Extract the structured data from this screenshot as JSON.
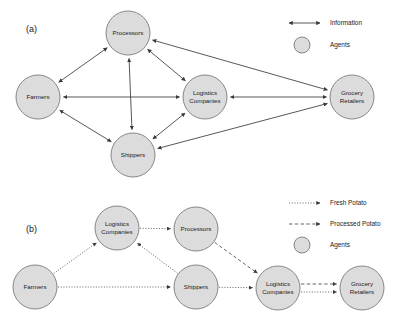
{
  "figure": {
    "panels": [
      {
        "id": "a",
        "label": "(a)",
        "nodes": [
          {
            "id": "a-processors",
            "label_line1": "Processors",
            "label_line2": "",
            "cx": 128,
            "cy": 33,
            "r": 22
          },
          {
            "id": "a-farmers",
            "label_line1": "Farmers",
            "label_line2": "",
            "cx": 38,
            "cy": 97,
            "r": 22
          },
          {
            "id": "a-logistics",
            "label_line1": "Logistics",
            "label_line2": "Companies",
            "cx": 205,
            "cy": 97,
            "r": 22
          },
          {
            "id": "a-grocery",
            "label_line1": "Grocery",
            "label_line2": "Retailers",
            "cx": 352,
            "cy": 97,
            "r": 22
          },
          {
            "id": "a-shippers",
            "label_line1": "Shippers",
            "label_line2": "",
            "cx": 133,
            "cy": 155,
            "r": 22
          }
        ],
        "edges": [
          {
            "from": "a-farmers",
            "to": "a-processors",
            "style": "solid",
            "arrows": "both"
          },
          {
            "from": "a-farmers",
            "to": "a-logistics",
            "style": "solid",
            "arrows": "both"
          },
          {
            "from": "a-farmers",
            "to": "a-shippers",
            "style": "solid",
            "arrows": "both"
          },
          {
            "from": "a-processors",
            "to": "a-logistics",
            "style": "solid",
            "arrows": "both"
          },
          {
            "from": "a-processors",
            "to": "a-shippers",
            "style": "solid",
            "arrows": "both"
          },
          {
            "from": "a-processors",
            "to": "a-grocery",
            "style": "solid",
            "arrows": "both"
          },
          {
            "from": "a-logistics",
            "to": "a-shippers",
            "style": "solid",
            "arrows": "both"
          },
          {
            "from": "a-logistics",
            "to": "a-grocery",
            "style": "solid",
            "arrows": "both"
          },
          {
            "from": "a-shippers",
            "to": "a-grocery",
            "style": "solid",
            "arrows": "both"
          }
        ],
        "legend": [
          {
            "id": "a-legend-information",
            "kind": "arrow-both",
            "style": "solid",
            "label": "Information"
          },
          {
            "id": "a-legend-agents",
            "kind": "circle",
            "style": "node",
            "label": "Agents"
          }
        ]
      },
      {
        "id": "b",
        "label": "(b)",
        "nodes": [
          {
            "id": "b-logistics-1",
            "label_line1": "Logistics",
            "label_line2": "Companies",
            "cx": 117,
            "cy": 228,
            "r": 22
          },
          {
            "id": "b-processors",
            "label_line1": "Processors",
            "label_line2": "",
            "cx": 196,
            "cy": 229,
            "r": 22
          },
          {
            "id": "b-farmers",
            "label_line1": "Farmers",
            "label_line2": "",
            "cx": 35,
            "cy": 287,
            "r": 22
          },
          {
            "id": "b-shippers",
            "label_line1": "Shippers",
            "label_line2": "",
            "cx": 196,
            "cy": 287,
            "r": 22
          },
          {
            "id": "b-logistics-2",
            "label_line1": "Logistics",
            "label_line2": "Companies",
            "cx": 278,
            "cy": 288,
            "r": 22
          },
          {
            "id": "b-grocery",
            "label_line1": "Grocery",
            "label_line2": "Retailers",
            "cx": 362,
            "cy": 288,
            "r": 22
          }
        ],
        "edges": [
          {
            "from": "b-farmers",
            "to": "b-logistics-1",
            "style": "dotted",
            "arrows": "end"
          },
          {
            "from": "b-farmers",
            "to": "b-shippers",
            "style": "dotted",
            "arrows": "end"
          },
          {
            "from": "b-logistics-1",
            "to": "b-processors",
            "style": "dotted",
            "arrows": "end"
          },
          {
            "from": "b-shippers",
            "to": "b-logistics-1",
            "style": "dotted",
            "arrows": "end"
          },
          {
            "from": "b-shippers",
            "to": "b-logistics-2",
            "style": "dotted",
            "arrows": "end"
          },
          {
            "from": "b-processors",
            "to": "b-logistics-2",
            "style": "dashed",
            "arrows": "end"
          },
          {
            "from": "b-logistics-2",
            "to": "b-grocery",
            "style": "dashed",
            "arrows": "end"
          },
          {
            "from": "b-logistics-2",
            "to": "b-grocery",
            "style": "dotted",
            "arrows": "end"
          }
        ],
        "legend": [
          {
            "id": "b-legend-fresh",
            "kind": "arrow-end",
            "style": "dotted",
            "label": "Fresh Potato"
          },
          {
            "id": "b-legend-processed",
            "kind": "arrow-end",
            "style": "dashed",
            "label": "Processed Potato"
          },
          {
            "id": "b-legend-agents",
            "kind": "circle",
            "style": "node",
            "label": "Agents"
          }
        ]
      }
    ]
  },
  "colors": {
    "node_fill": "#dcdcdc",
    "node_stroke": "#7a7a7a",
    "edge": "#3a3a3a",
    "text": "#1a1a1a",
    "background": "#ffffff"
  }
}
